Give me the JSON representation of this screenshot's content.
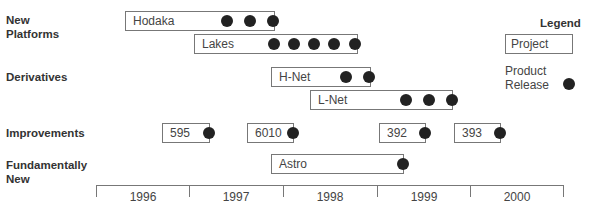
{
  "rows": {
    "new_platforms": "New\nPlatforms",
    "derivatives": "Derivatives",
    "improvements": "Improvements",
    "fundamentally_new": "Fundamentally\nNew"
  },
  "projects": [
    {
      "name": "Hodaka",
      "category": "New Platforms",
      "releases": 3
    },
    {
      "name": "Lakes",
      "category": "New Platforms",
      "releases": 5
    },
    {
      "name": "H-Net",
      "category": "Derivatives",
      "releases": 2
    },
    {
      "name": "L-Net",
      "category": "Derivatives",
      "releases": 3
    },
    {
      "name": "595",
      "category": "Improvements",
      "releases": 1
    },
    {
      "name": "6010",
      "category": "Improvements",
      "releases": 1
    },
    {
      "name": "392",
      "category": "Improvements",
      "releases": 1
    },
    {
      "name": "393",
      "category": "Improvements",
      "releases": 1
    },
    {
      "name": "Astro",
      "category": "Fundamentally New",
      "releases": 1
    }
  ],
  "axis": {
    "years": [
      "1996",
      "1997",
      "1998",
      "1999",
      "2000"
    ]
  },
  "legend": {
    "title": "Legend",
    "project_label": "Project",
    "release_label": "Product\nRelease"
  }
}
